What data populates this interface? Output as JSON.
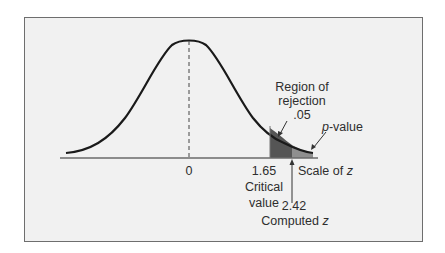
{
  "figure": {
    "type": "normal-distribution-hypothesis-test",
    "labels": {
      "zero": "0",
      "critical_value_number": "1.65",
      "critical_value_word1": "Critical",
      "critical_value_word2": "value",
      "computed_number": "2.42",
      "computed_word": "Computed",
      "computed_var": "z",
      "region_line1": "Region of",
      "region_line2": "rejection",
      "region_alpha": ".05",
      "pvalue_var": "p",
      "pvalue_rest": "-value",
      "scale_word": "Scale of",
      "scale_var": "z"
    },
    "values": {
      "mean": 0,
      "critical_z": 1.65,
      "computed_z": 2.42,
      "alpha": 0.05
    },
    "colors": {
      "curve": "#1a1a1a",
      "rejection_fill": "#555555",
      "pvalue_fill": "#8a8a8a",
      "background": "#f1f1f1",
      "frame": "#6e6e6e",
      "text": "#2e2e2e"
    }
  }
}
